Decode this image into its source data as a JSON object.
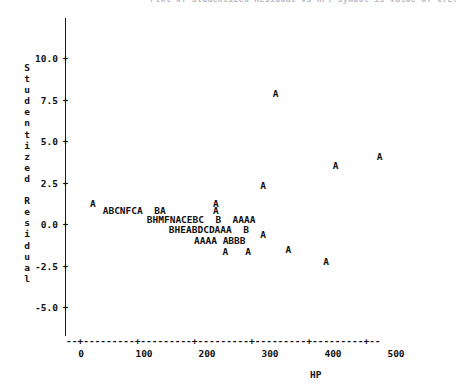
{
  "chart_data": {
    "type": "scatter",
    "title": "Plot of Studentized Residual vs HP. Symbol is value of CYL.",
    "xlabel": "HP",
    "ylabel": "Studentized Residual",
    "xlim": [
      0,
      500
    ],
    "ylim": [
      -5.0,
      10.0
    ],
    "xticks": [
      0,
      100,
      200,
      300,
      400,
      500
    ],
    "yticks": [
      10.0,
      7.5,
      5.0,
      2.5,
      0.0,
      -2.5,
      -5.0
    ],
    "ytick_labels": [
      "10.0",
      "7.5",
      "5.0",
      "2.5",
      "0.0",
      "-2.5",
      "-5.0"
    ],
    "xtick_labels": [
      "0",
      "100",
      "200",
      "300",
      "400",
      "500"
    ],
    "grid": false,
    "legend": "none",
    "symbol_meaning": "Plot character encodes count/level at that cell (A=1, B=2, C=3, ...)",
    "points": [
      {
        "symbol": "A",
        "hp": 20,
        "resid": 1.3
      },
      {
        "symbol": "A",
        "hp": 40,
        "resid": 0.9
      },
      {
        "symbol": "B",
        "hp": 50,
        "resid": 0.9
      },
      {
        "symbol": "C",
        "hp": 60,
        "resid": 0.9
      },
      {
        "symbol": "N",
        "hp": 70,
        "resid": 0.9
      },
      {
        "symbol": "F",
        "hp": 80,
        "resid": 0.9
      },
      {
        "symbol": "C",
        "hp": 90,
        "resid": 0.9
      },
      {
        "symbol": "A",
        "hp": 100,
        "resid": 0.9
      },
      {
        "symbol": "B",
        "hp": 130,
        "resid": 0.9
      },
      {
        "symbol": "A",
        "hp": 140,
        "resid": 0.9
      },
      {
        "symbol": "A",
        "hp": 215,
        "resid": 1.3
      },
      {
        "symbol": "A",
        "hp": 215,
        "resid": 0.9
      },
      {
        "symbol": "B",
        "hp": 110,
        "resid": 0.35
      },
      {
        "symbol": "H",
        "hp": 120,
        "resid": 0.35
      },
      {
        "symbol": "M",
        "hp": 130,
        "resid": 0.35
      },
      {
        "symbol": "F",
        "hp": 140,
        "resid": 0.35
      },
      {
        "symbol": "N",
        "hp": 150,
        "resid": 0.35
      },
      {
        "symbol": "A",
        "hp": 160,
        "resid": 0.35
      },
      {
        "symbol": "C",
        "hp": 170,
        "resid": 0.35
      },
      {
        "symbol": "E",
        "hp": 180,
        "resid": 0.35
      },
      {
        "symbol": "B",
        "hp": 190,
        "resid": 0.35
      },
      {
        "symbol": "C",
        "hp": 200,
        "resid": 0.35
      },
      {
        "symbol": "B",
        "hp": 225,
        "resid": 0.35
      },
      {
        "symbol": "A",
        "hp": 255,
        "resid": 0.35
      },
      {
        "symbol": "A",
        "hp": 265,
        "resid": 0.35
      },
      {
        "symbol": "A",
        "hp": 275,
        "resid": 0.35
      },
      {
        "symbol": "A",
        "hp": 285,
        "resid": 0.35
      },
      {
        "symbol": "B",
        "hp": 145,
        "resid": -0.3
      },
      {
        "symbol": "H",
        "hp": 155,
        "resid": -0.3
      },
      {
        "symbol": "E",
        "hp": 165,
        "resid": -0.3
      },
      {
        "symbol": "A",
        "hp": 175,
        "resid": -0.3
      },
      {
        "symbol": "B",
        "hp": 185,
        "resid": -0.3
      },
      {
        "symbol": "D",
        "hp": 195,
        "resid": -0.3
      },
      {
        "symbol": "C",
        "hp": 205,
        "resid": -0.3
      },
      {
        "symbol": "D",
        "hp": 215,
        "resid": -0.3
      },
      {
        "symbol": "A",
        "hp": 225,
        "resid": -0.3
      },
      {
        "symbol": "A",
        "hp": 235,
        "resid": -0.3
      },
      {
        "symbol": "A",
        "hp": 245,
        "resid": -0.3
      },
      {
        "symbol": "B",
        "hp": 275,
        "resid": -0.3
      },
      {
        "symbol": "A",
        "hp": 185,
        "resid": -0.95
      },
      {
        "symbol": "A",
        "hp": 195,
        "resid": -0.95
      },
      {
        "symbol": "A",
        "hp": 205,
        "resid": -0.95
      },
      {
        "symbol": "A",
        "hp": 215,
        "resid": -0.95
      },
      {
        "symbol": "A",
        "hp": 235,
        "resid": -0.95
      },
      {
        "symbol": "B",
        "hp": 245,
        "resid": -0.95
      },
      {
        "symbol": "B",
        "hp": 255,
        "resid": -0.95
      },
      {
        "symbol": "B",
        "hp": 265,
        "resid": -0.95
      },
      {
        "symbol": "A",
        "hp": 230,
        "resid": -1.6
      },
      {
        "symbol": "A",
        "hp": 255,
        "resid": -1.6
      },
      {
        "symbol": "A",
        "hp": 290,
        "resid": 2.4
      },
      {
        "symbol": "A",
        "hp": 290,
        "resid": -0.6
      },
      {
        "symbol": "A",
        "hp": 310,
        "resid": 7.9
      },
      {
        "symbol": "A",
        "hp": 330,
        "resid": -1.5
      },
      {
        "symbol": "A",
        "hp": 390,
        "resid": -2.2
      },
      {
        "symbol": "A",
        "hp": 405,
        "resid": 3.6
      },
      {
        "symbol": "A",
        "hp": 475,
        "resid": 4.1
      }
    ],
    "rows": [
      {
        "y": 1.3,
        "x_start": 20,
        "text": "A"
      },
      {
        "y": 1.3,
        "x_start": 215,
        "text": "A"
      },
      {
        "y": 0.9,
        "x_start": 40,
        "text": "ABCNFCA  BA"
      },
      {
        "y": 0.9,
        "x_start": 215,
        "text": "A"
      },
      {
        "y": 0.35,
        "x_start": 110,
        "text": "BHMFNACEBC  B  AAAA"
      },
      {
        "y": -0.3,
        "x_start": 145,
        "text": "BHEABDCDAAA  B"
      },
      {
        "y": -0.95,
        "x_start": 185,
        "text": "AAAA ABBB"
      },
      {
        "y": -1.6,
        "x_start": 230,
        "text": "A   A"
      }
    ]
  },
  "axis": {
    "y_title_chars": [
      "S",
      "t",
      "u",
      "d",
      "e",
      "n",
      "t",
      "i",
      "z",
      "e",
      "d",
      " ",
      "R",
      "e",
      "s",
      "i",
      "d",
      "u",
      "a",
      "l"
    ],
    "x_title": "HP",
    "tick_marker": "+",
    "x_axis_line": "--+---------+---------+---------+---------+---------+--"
  },
  "colors": {
    "ink": "#111111",
    "background": "#ffffff",
    "faint_title": "#b9b9bf"
  }
}
